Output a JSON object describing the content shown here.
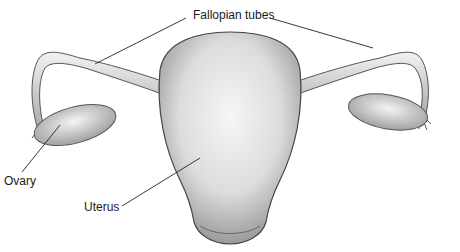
{
  "diagram": {
    "labels": {
      "fallopian_tubes": "Fallopian tubes",
      "ovary": "Ovary",
      "uterus": "Uterus"
    },
    "colors": {
      "background": "#ffffff",
      "ink": "#1a1a1a",
      "shade_dark": "#8a8a8a",
      "shade_mid": "#c4c4c4",
      "shade_light": "#eeeeee"
    }
  }
}
